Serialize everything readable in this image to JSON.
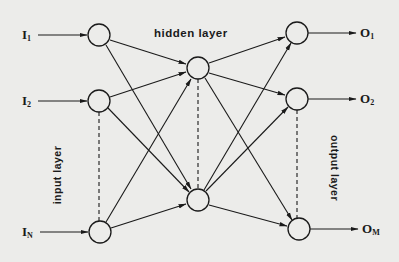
{
  "diagram": {
    "colors": {
      "background": "#ececea",
      "ink": "#1a1a1a"
    },
    "layers": {
      "input": {
        "label": "input layer"
      },
      "hidden": {
        "label": "hidden layer"
      },
      "output": {
        "label": "output layer"
      }
    },
    "inputs": [
      {
        "base": "I",
        "sub": "1"
      },
      {
        "base": "I",
        "sub": "2"
      },
      {
        "base": "I",
        "sub": "N"
      }
    ],
    "outputs": [
      {
        "base": "O",
        "sub": "1"
      },
      {
        "base": "O",
        "sub": "2"
      },
      {
        "base": "O",
        "sub": "M"
      }
    ]
  }
}
